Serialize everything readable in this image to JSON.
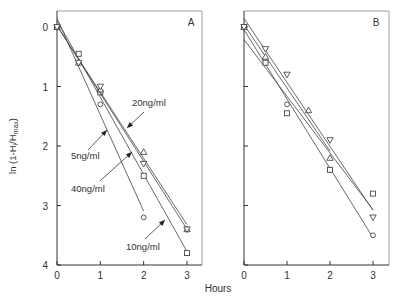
{
  "chart_data": [
    {
      "type": "scatter",
      "panel": "A",
      "panel_label": "A",
      "xlabel": "Hours",
      "ylabel": "ln (1-Hi/Hmax)",
      "xlim": [
        0,
        3
      ],
      "ylim": [
        0,
        4
      ],
      "y_inverted": true,
      "x_ticks": [
        "0",
        "1",
        "2",
        "3"
      ],
      "y_ticks": [
        "0",
        "1",
        "2",
        "3",
        "4"
      ],
      "annotations": [
        "20ng/ml",
        "5ng/ml",
        "40ng/ml",
        "10ng/ml"
      ],
      "series": [
        {
          "name": "5ng/ml",
          "marker": "circle",
          "x": [
            0,
            0.5,
            1,
            2
          ],
          "y": [
            0,
            0.6,
            1.3,
            3.2
          ]
        },
        {
          "name": "10ng/ml",
          "marker": "square",
          "x": [
            0,
            0.5,
            1,
            2,
            3
          ],
          "y": [
            0,
            0.45,
            1.1,
            2.5,
            3.8
          ]
        },
        {
          "name": "20ng/ml",
          "marker": "triangle-up",
          "x": [
            0,
            0.5,
            1,
            2,
            3
          ],
          "y": [
            0,
            0.6,
            1.05,
            2.1,
            3.4
          ]
        },
        {
          "name": "40ng/ml",
          "marker": "triangle-down",
          "x": [
            0,
            0.5,
            1,
            2,
            3
          ],
          "y": [
            0,
            0.6,
            1.0,
            2.3,
            3.4
          ]
        }
      ]
    },
    {
      "type": "scatter",
      "panel": "B",
      "panel_label": "B",
      "xlabel": "Hours",
      "xlim": [
        0,
        3
      ],
      "ylim": [
        0,
        4
      ],
      "y_inverted": true,
      "x_ticks": [
        "0",
        "1",
        "2",
        "3"
      ],
      "series": [
        {
          "name": "circle",
          "marker": "circle",
          "x": [
            0,
            0.5,
            1,
            2,
            3
          ],
          "y": [
            0,
            0.6,
            1.3,
            2.4,
            3.5
          ]
        },
        {
          "name": "square",
          "marker": "square",
          "x": [
            0,
            0.5,
            1,
            2,
            3
          ],
          "y": [
            0,
            0.6,
            1.45,
            2.4,
            2.8
          ]
        },
        {
          "name": "triangle-up",
          "marker": "triangle-up",
          "x": [
            0,
            0.5,
            1.5,
            2
          ],
          "y": [
            0,
            0.5,
            1.4,
            2.2
          ]
        },
        {
          "name": "triangle-down",
          "marker": "triangle-down",
          "x": [
            0,
            0.5,
            1,
            2,
            3
          ],
          "y": [
            0,
            0.37,
            0.8,
            1.9,
            3.2
          ]
        }
      ]
    }
  ],
  "axis": {
    "xlabel": "Hours",
    "ylabel_main": "ln (1-H",
    "ylabel_sub_i": "i",
    "ylabel_mid": "/H",
    "ylabel_sub_max": "max",
    "ylabel_end": ")"
  }
}
